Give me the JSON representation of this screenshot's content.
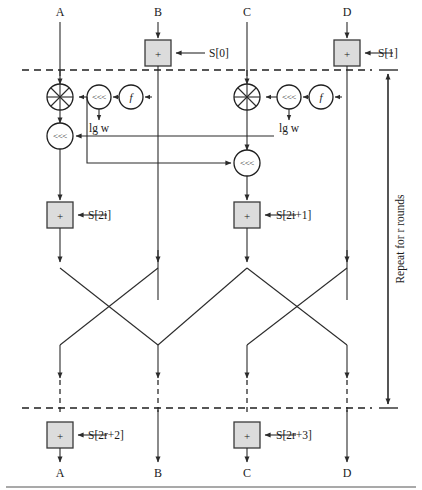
{
  "figure": {
    "type": "block-cipher-round-diagram"
  },
  "colors": {
    "box_fill": "#dcdcdc",
    "box_stroke": "#3a3a3a",
    "wire": "#2b2b2b",
    "text": "#1a1a1a",
    "footer_rule": "#8c8c8c"
  },
  "inputs": {
    "a": "A",
    "b": "B",
    "c": "C",
    "d": "D"
  },
  "outputs": {
    "a": "A",
    "b": "B",
    "c": "C",
    "d": "D"
  },
  "pre_whitening": {
    "b_key": "S[0]",
    "d_key": "S[1]",
    "op": "+"
  },
  "post_whitening": {
    "a_key": "S[2r+2]",
    "c_key": "S[2r+3]",
    "op": "+"
  },
  "round_keys": {
    "left": "S[2i]",
    "right": "S[2i+1]"
  },
  "operators": {
    "xor": "+",
    "rotate": "<<<",
    "function": "f",
    "add": "+"
  },
  "rotate_amount": {
    "left": "lg w",
    "right": "lg w"
  },
  "annotation": {
    "repeat": "Repeat for r rounds"
  }
}
